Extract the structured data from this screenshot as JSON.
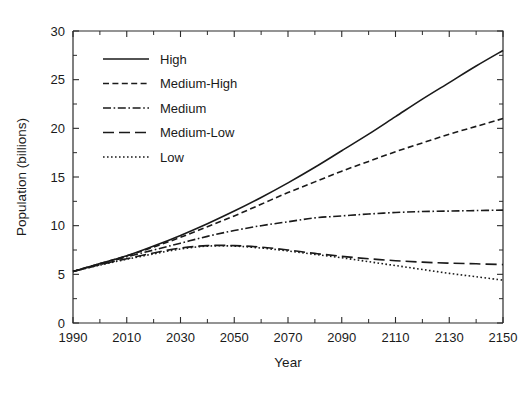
{
  "chart_data": {
    "type": "line",
    "title": "",
    "xlabel": "Year",
    "ylabel": "Population (billions)",
    "xlim": [
      1990,
      2150
    ],
    "ylim": [
      0,
      30
    ],
    "grid": false,
    "legend_position": "upper-left-inside",
    "x_ticks_major": [
      1990,
      2010,
      2030,
      2050,
      2070,
      2090,
      2110,
      2130,
      2150
    ],
    "x_tick_labels": [
      "1990",
      "2010",
      "2030",
      "2050",
      "2070",
      "2090",
      "2110",
      "2130",
      "2150"
    ],
    "x_ticks_minor_step": 10,
    "y_ticks_major": [
      0,
      5,
      10,
      15,
      20,
      25,
      30
    ],
    "y_tick_labels": [
      "0",
      "5",
      "10",
      "15",
      "20",
      "25",
      "30"
    ],
    "x": [
      1990,
      2000,
      2010,
      2020,
      2030,
      2040,
      2050,
      2060,
      2070,
      2080,
      2090,
      2100,
      2110,
      2120,
      2130,
      2140,
      2150
    ],
    "series": [
      {
        "name": "High",
        "dash": "solid",
        "values": [
          5.3,
          6.1,
          6.9,
          7.9,
          9.0,
          10.2,
          11.5,
          12.9,
          14.4,
          16.0,
          17.7,
          19.4,
          21.2,
          23.0,
          24.7,
          26.4,
          28.0
        ]
      },
      {
        "name": "Medium-High",
        "dash": "dashed",
        "values": [
          5.3,
          6.1,
          6.9,
          7.8,
          8.8,
          9.9,
          11.0,
          12.2,
          13.4,
          14.5,
          15.6,
          16.6,
          17.6,
          18.5,
          19.4,
          20.2,
          21.0
        ]
      },
      {
        "name": "Medium",
        "dash": "dashdot",
        "values": [
          5.3,
          6.0,
          6.8,
          7.5,
          8.2,
          8.9,
          9.5,
          10.0,
          10.4,
          10.8,
          11.0,
          11.2,
          11.35,
          11.45,
          11.5,
          11.55,
          11.6
        ]
      },
      {
        "name": "Medium-Low",
        "dash": "longdash",
        "values": [
          5.3,
          6.0,
          6.6,
          7.2,
          7.7,
          7.95,
          7.95,
          7.8,
          7.5,
          7.15,
          6.85,
          6.6,
          6.4,
          6.25,
          6.15,
          6.08,
          6.0
        ]
      },
      {
        "name": "Low",
        "dash": "dotted",
        "values": [
          5.3,
          5.95,
          6.55,
          7.1,
          7.6,
          7.9,
          7.9,
          7.7,
          7.4,
          7.05,
          6.7,
          6.3,
          5.9,
          5.5,
          5.1,
          4.75,
          4.4
        ]
      }
    ]
  },
  "legend": {
    "entries": [
      {
        "label": "High",
        "dash": "solid"
      },
      {
        "label": "Medium-High",
        "dash": "dashed"
      },
      {
        "label": "Medium",
        "dash": "dashdot"
      },
      {
        "label": "Medium-Low",
        "dash": "longdash"
      },
      {
        "label": "Low",
        "dash": "dotted"
      }
    ]
  }
}
